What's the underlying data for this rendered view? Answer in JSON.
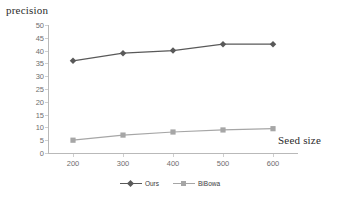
{
  "chart_data": {
    "type": "line",
    "title": "",
    "xlabel": "Seed size",
    "ylabel": "precision",
    "x": [
      200,
      300,
      400,
      500,
      600
    ],
    "xtick_labels": [
      "200",
      "300",
      "400",
      "500",
      "600"
    ],
    "ytick_labels": [
      "0",
      "5",
      "10",
      "15",
      "20",
      "25",
      "30",
      "35",
      "40",
      "45",
      "50"
    ],
    "yticks": [
      0,
      5,
      10,
      15,
      20,
      25,
      30,
      35,
      40,
      45,
      50
    ],
    "ylim": [
      0,
      50
    ],
    "xlim": [
      150,
      650
    ],
    "grid": false,
    "legend_position": "bottom",
    "series": [
      {
        "name": "Ours",
        "values": [
          36,
          39,
          40,
          42.5,
          42.5
        ],
        "color": "#595959",
        "marker": "diamond"
      },
      {
        "name": "BiBowa",
        "values": [
          5,
          7,
          8.2,
          9,
          9.5
        ],
        "color": "#a6a6a6",
        "marker": "square"
      }
    ]
  },
  "legend": {
    "entries": [
      {
        "label": "Ours"
      },
      {
        "label": "BiBowa"
      }
    ]
  }
}
